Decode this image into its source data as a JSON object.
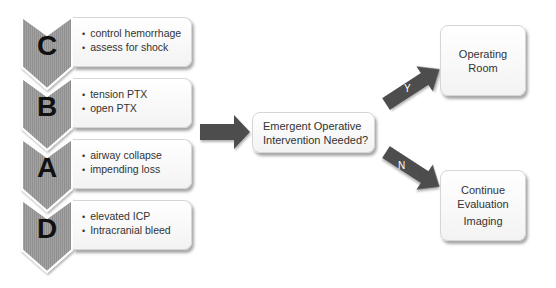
{
  "colors": {
    "chevron_gray": "#9a9a9a",
    "arrow_dark": "#4d4d4d",
    "box_border": "#d6d6d6",
    "text": "#333333"
  },
  "steps": [
    {
      "letter": "C",
      "items": [
        "control hemorrhage",
        "assess for shock"
      ]
    },
    {
      "letter": "B",
      "items": [
        "tension PTX",
        "open PTX"
      ]
    },
    {
      "letter": "A",
      "items": [
        "airway collapse",
        "impending loss"
      ]
    },
    {
      "letter": "D",
      "items": [
        "elevated ICP",
        "Intracranial bleed"
      ]
    }
  ],
  "decision": {
    "line1": "Emergent Operative",
    "line2": "Intervention Needed?"
  },
  "branches": {
    "yes": {
      "label": "Y",
      "outcome_line1": "Operating",
      "outcome_line2": "Room"
    },
    "no": {
      "label": "N",
      "outcome_line1": "Continue",
      "outcome_line2": "Evaluation",
      "outcome_line3": "Imaging"
    }
  }
}
